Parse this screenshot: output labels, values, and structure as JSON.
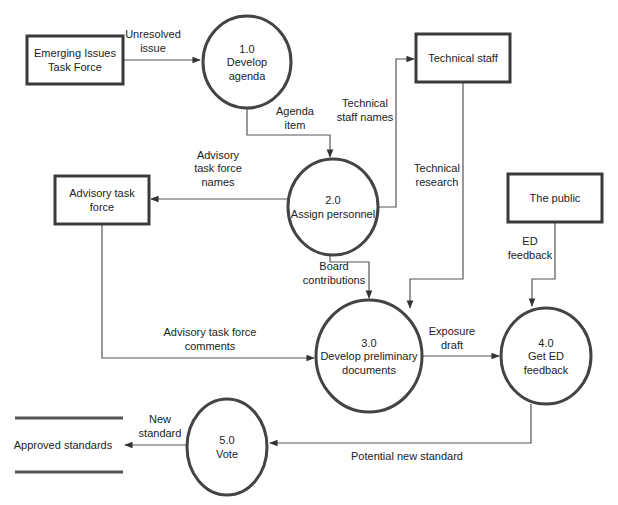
{
  "diagram": {
    "type": "data-flow-diagram",
    "entities": [
      {
        "id": "eitf",
        "lines": [
          "Emerging Issues",
          "Task Force"
        ],
        "x": 27,
        "y": 36,
        "w": 96,
        "h": 48
      },
      {
        "id": "tech",
        "lines": [
          "Technical staff"
        ],
        "x": 416,
        "y": 34,
        "w": 94,
        "h": 48
      },
      {
        "id": "atf",
        "lines": [
          "Advisory task",
          "force"
        ],
        "x": 55,
        "y": 176,
        "w": 94,
        "h": 48
      },
      {
        "id": "public",
        "lines": [
          "The public"
        ],
        "x": 508,
        "y": 174,
        "w": 94,
        "h": 48
      }
    ],
    "processes": [
      {
        "id": "p1",
        "lines": [
          "1.0",
          "Develop",
          "agenda"
        ],
        "cx": 247,
        "cy": 62,
        "rx": 44,
        "ry": 46
      },
      {
        "id": "p2",
        "lines": [
          "2.0",
          "Assign personnel"
        ],
        "cx": 333,
        "cy": 207,
        "rx": 45,
        "ry": 48
      },
      {
        "id": "p3",
        "lines": [
          "3.0",
          "Develop preliminary",
          "documents"
        ],
        "cx": 369,
        "cy": 356,
        "rx": 53,
        "ry": 56
      },
      {
        "id": "p4",
        "lines": [
          "4.0",
          "Get ED",
          "feedback"
        ],
        "cx": 546,
        "cy": 356,
        "rx": 45,
        "ry": 48
      },
      {
        "id": "p5",
        "lines": [
          "5.0",
          "Vote"
        ],
        "cx": 227,
        "cy": 447,
        "rx": 40,
        "ry": 48
      }
    ],
    "store": {
      "label": "Approved standards",
      "x1": 15,
      "x2": 123,
      "y_top": 418,
      "y_bottom": 472
    },
    "flows": [
      {
        "id": "f1",
        "label": [
          "Unresolved",
          "issue"
        ],
        "label_x": 153,
        "label_y": 41,
        "points": [
          [
            123,
            60
          ],
          [
            200,
            60
          ]
        ]
      },
      {
        "id": "f2",
        "label": [
          "Agenda",
          "item"
        ],
        "label_x": 295,
        "label_y": 118,
        "points": [
          [
            247,
            108
          ],
          [
            247,
            135
          ],
          [
            330,
            135
          ],
          [
            330,
            157
          ]
        ]
      },
      {
        "id": "f3",
        "label": [
          "Technical",
          "staff names"
        ],
        "label_x": 365,
        "label_y": 110,
        "points": [
          [
            378,
            207
          ],
          [
            396,
            207
          ],
          [
            396,
            59
          ],
          [
            414,
            59
          ]
        ]
      },
      {
        "id": "f4",
        "label": [
          "Advisory",
          "task force",
          "names"
        ],
        "label_x": 218,
        "label_y": 168,
        "points": [
          [
            288,
            199
          ],
          [
            151,
            199
          ]
        ]
      },
      {
        "id": "f5",
        "label": [
          "Technical",
          "research"
        ],
        "label_x": 437,
        "label_y": 175,
        "points": [
          [
            463,
            82
          ],
          [
            463,
            279
          ],
          [
            410,
            279
          ],
          [
            410,
            308
          ]
        ]
      },
      {
        "id": "f6",
        "label": [
          "ED",
          "feedback"
        ],
        "label_x": 530,
        "label_y": 248,
        "points": [
          [
            555,
            222
          ],
          [
            555,
            279
          ],
          [
            532,
            279
          ],
          [
            532,
            306
          ]
        ]
      },
      {
        "id": "f7",
        "label": [
          "Board",
          "contributions"
        ],
        "label_x": 334,
        "label_y": 273,
        "points": [
          [
            330,
            255
          ],
          [
            330,
            262
          ],
          [
            369,
            262
          ],
          [
            369,
            298
          ]
        ]
      },
      {
        "id": "f8",
        "label": [
          "Advisory task force",
          "comments"
        ],
        "label_x": 210,
        "label_y": 339,
        "points": [
          [
            102,
            224
          ],
          [
            102,
            358
          ],
          [
            314,
            358
          ]
        ]
      },
      {
        "id": "f9",
        "label": [
          "Exposure",
          "draft"
        ],
        "label_x": 452,
        "label_y": 338,
        "points": [
          [
            422,
            356
          ],
          [
            499,
            356
          ]
        ]
      },
      {
        "id": "f10",
        "label": [
          "Potential new standard"
        ],
        "label_x": 407,
        "label_y": 456,
        "points": [
          [
            531,
            404
          ],
          [
            531,
            443
          ],
          [
            270,
            443
          ]
        ]
      },
      {
        "id": "f11",
        "label": [
          "New",
          "standard"
        ],
        "label_x": 160,
        "label_y": 426,
        "points": [
          [
            187,
            445
          ],
          [
            125,
            445
          ]
        ]
      }
    ]
  },
  "colors": {
    "stroke": "#3a3a3a",
    "flow": "#555555",
    "text": "#222222",
    "background": "#ffffff"
  }
}
